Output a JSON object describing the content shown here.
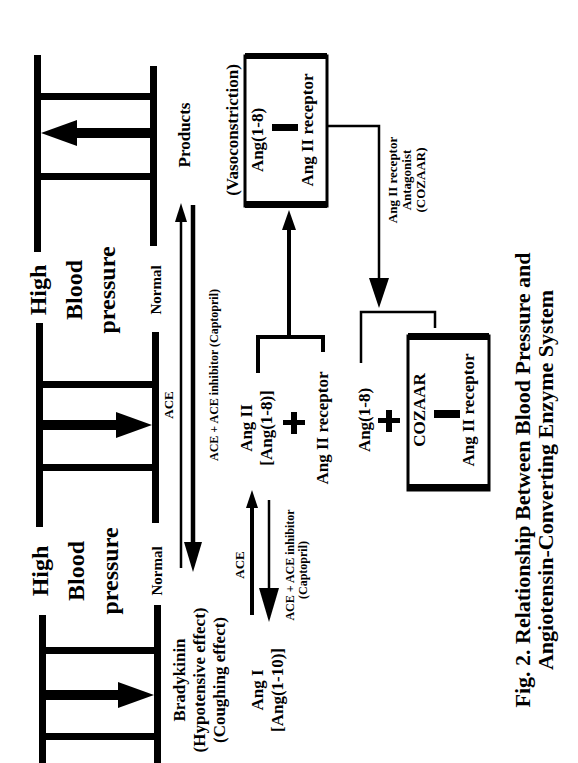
{
  "caption": {
    "line1": "Fig. 2. Relationship Between Blood Pressure and",
    "line2": "Angiotensin-Converting Enzyme System"
  },
  "gauges": [
    {
      "id": "top",
      "high_label": "High",
      "normal_label": "Normal",
      "blood_label": "Blood",
      "pressure_label": "pressure",
      "direction": "decrease"
    },
    {
      "id": "middle",
      "high_label": "High",
      "normal_label": "Normal",
      "blood_label": "Blood",
      "pressure_label": "pressure",
      "direction": "increase"
    },
    {
      "id": "bottom",
      "direction": "increase"
    }
  ],
  "upper_gauge_labels": {
    "high": "High",
    "blood": "Blood",
    "pressure": "pressure",
    "normal": "Normal"
  },
  "lower_gauge_labels": {
    "high": "High",
    "blood": "Blood",
    "pressure": "pressure",
    "normal": "Normal"
  },
  "nodes": {
    "products": "Products",
    "bradykinin": {
      "name": "Bradykinin",
      "effect1": "(Hypotensive effect)",
      "effect2": "(Coughing effect)"
    },
    "ang1": {
      "name": "Ang I",
      "formula": "[Ang(1-10)]"
    },
    "ang2": {
      "name": "Ang II",
      "formula": "[Ang(1-8)]",
      "plus": "+",
      "receptor": "Ang II receptor"
    },
    "vasoconstriction_box": {
      "label": "(Vasoconstriction)",
      "top": "Ang(1-8)",
      "bottom": "Ang II receptor"
    },
    "antagonist_label": {
      "line1": "Ang II receptor",
      "line2": "Antagonist",
      "line3": "(COZAAR)"
    },
    "blocked": {
      "ang": "Ang(1-8)",
      "plus": "+",
      "box_top": "COZAAR",
      "box_bottom": "Ang II receptor"
    }
  },
  "arrows": {
    "ace_bradykinin_label": "ACE",
    "ace_inhibitor_long_label": "ACE + ACE inhibitor (Captopril)",
    "ace_ang_label": "ACE",
    "ace_inhibitor_short_label1": "ACE + ACE inhibitor",
    "ace_inhibitor_short_label2": "(Captopril)"
  }
}
